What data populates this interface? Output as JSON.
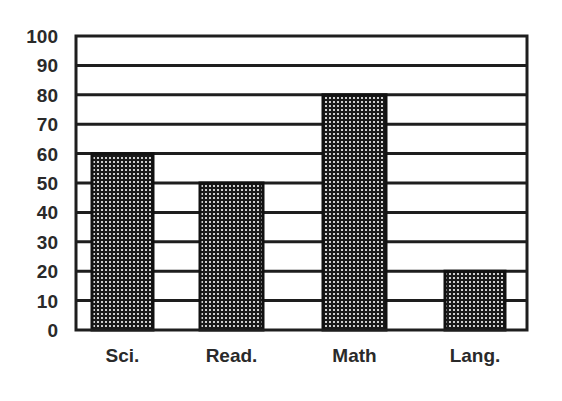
{
  "chart_data": {
    "type": "bar",
    "title": "",
    "xlabel": "",
    "ylabel": "",
    "categories": [
      "Sci.",
      "Read.",
      "Math",
      "Lang."
    ],
    "values": [
      60,
      50,
      80,
      20
    ],
    "ylim": [
      0,
      100
    ],
    "yticks": [
      0,
      10,
      20,
      30,
      40,
      50,
      60,
      70,
      80,
      90,
      100
    ],
    "grid": true,
    "grid_axis": "y",
    "legend": null,
    "bar_fill": "dotted-dark-pattern",
    "colors": {
      "bar_fill": "#1a1a1a",
      "bar_dots": "#d0d0d0",
      "grid": "#1e1e1e",
      "frame": "#1e1e1e",
      "text": "#2a2a2a",
      "background": "#ffffff"
    }
  },
  "layout": {
    "plot": {
      "left": 76,
      "top": 36,
      "right": 527,
      "bottom": 330
    },
    "bars": [
      {
        "x0": 92,
        "x1": 153
      },
      {
        "x0": 200,
        "x1": 263
      },
      {
        "x0": 323,
        "x1": 386
      },
      {
        "x0": 445,
        "x1": 505
      }
    ]
  }
}
